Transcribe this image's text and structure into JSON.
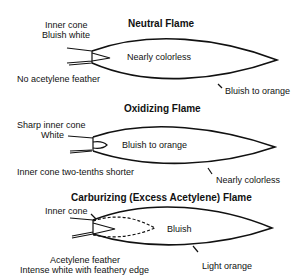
{
  "diagram": {
    "neutral": {
      "title": "Neutral Flame",
      "inner_cone_label_1": "Inner cone",
      "inner_cone_label_2": "Bluish white",
      "body_label": "Nearly colorless",
      "feather_label": "No acetylene feather",
      "outer_label": "Bluish to orange"
    },
    "oxidizing": {
      "title": "Oxidizing Flame",
      "inner_cone_label_1": "Sharp inner cone",
      "inner_cone_label_2": "White",
      "body_label": "Bluish to orange",
      "shorter_label": "Inner cone two-tenths shorter",
      "outer_label": "Nearly colorless"
    },
    "carburizing": {
      "title": "Carburizing (Excess Acetylene) Flame",
      "inner_cone_label": "Inner cone",
      "body_label": "Bluish",
      "feather_label_1": "Acetylene feather",
      "feather_label_2": "Intense white with feathery edge",
      "outer_label": "Light orange"
    }
  }
}
